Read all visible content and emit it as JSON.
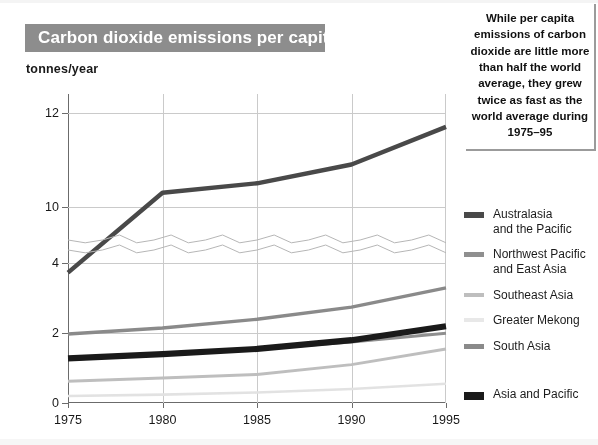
{
  "title": "Carbon dioxide emissions per capita",
  "axis_unit_label": "tonnes/year",
  "callout_text": "While per capita emissions of carbon dioxide are little more than half the world average, they grew twice as fast as the world average during 1975–95",
  "legend": {
    "items": [
      {
        "label": "Australasia\nand the Pacific",
        "color": "#4a4a4a",
        "swatch_height": 6
      },
      {
        "label": "Northwest Pacific\nand  East Asia",
        "color": "#8f8f8f",
        "swatch_height": 5
      },
      {
        "label": "Southeast Asia",
        "color": "#bdbdbd",
        "swatch_height": 4
      },
      {
        "label": "Greater Mekong",
        "color": "#e6e6e6",
        "swatch_height": 4
      },
      {
        "label": "South Asia",
        "color": "#8a8a8a",
        "swatch_height": 5
      },
      {
        "label": "Asia and Pacific",
        "color": "#1c1c1c",
        "swatch_height": 8
      }
    ]
  },
  "chart_data": {
    "type": "line",
    "title": "Carbon dioxide emissions per capita",
    "xlabel": "",
    "ylabel": "tonnes/year",
    "x": [
      1975,
      1980,
      1985,
      1990,
      1995
    ],
    "xtick_labels": [
      "1975",
      "1980",
      "1985",
      "1990",
      "1995"
    ],
    "ytick_labels": [
      "12",
      "10",
      "4",
      "2",
      "0"
    ],
    "ytick_values": [
      12,
      10,
      4,
      2,
      0
    ],
    "axis_break": {
      "present": true,
      "between": [
        4.3,
        9.4
      ],
      "style": "zigzag"
    },
    "grid": true,
    "legend_position": "right",
    "series": [
      {
        "name": "Australasia and the Pacific",
        "color": "#4a4a4a",
        "width": 4.4,
        "values": [
          8.6,
          10.3,
          10.5,
          10.9,
          11.7
        ]
      },
      {
        "name": "Northwest Pacific and  East Asia",
        "color": "#8f8f8f",
        "width": 3.0,
        "values": [
          1.25,
          1.4,
          1.55,
          1.75,
          2.0
        ]
      },
      {
        "name": "Southeast Asia",
        "color": "#bdbdbd",
        "width": 3.0,
        "values": [
          0.62,
          0.72,
          0.82,
          1.1,
          1.55
        ]
      },
      {
        "name": "Greater Mekong",
        "color": "#e0e0e0",
        "width": 2.6,
        "values": [
          0.2,
          0.24,
          0.3,
          0.4,
          0.55
        ]
      },
      {
        "name": "South Asia",
        "color": "#8a8a8a",
        "width": 3.4,
        "values": [
          1.98,
          2.15,
          2.4,
          2.75,
          3.3
        ]
      },
      {
        "name": "Asia and Pacific",
        "color": "#1c1c1c",
        "width": 6.2,
        "values": [
          1.28,
          1.4,
          1.55,
          1.8,
          2.2
        ]
      }
    ]
  }
}
